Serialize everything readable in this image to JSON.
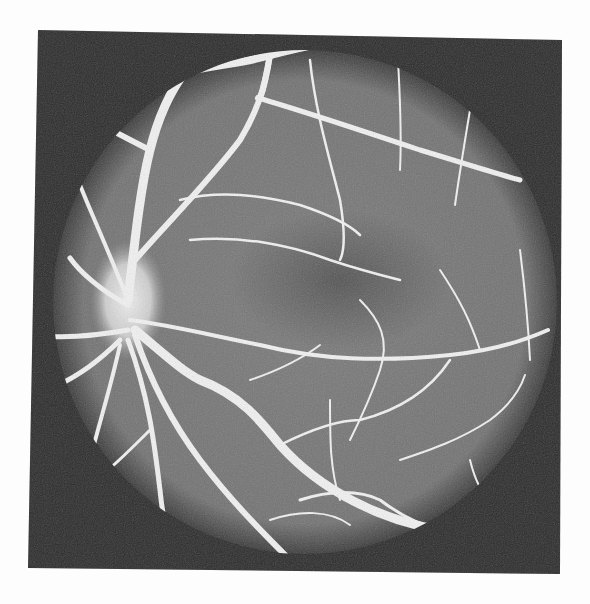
{
  "image": {
    "kind": "retinal fluorescein angiogram (grayscale fundus photograph)",
    "colors": {
      "page_background": "#fdfdfd",
      "frame_background": "#2b2b2b",
      "fundus_background": "#7a7a7a",
      "fundus_edge": "#3a3a3a",
      "vessel": "#f2f2f2",
      "optic_disc_glow": "#e8e8e8",
      "macula_dark": "#4a4a4a"
    },
    "frame": {
      "points": "38,30 562,40 560,574 28,568"
    },
    "fundus": {
      "cx": 305,
      "cy": 302,
      "r": 252
    },
    "optic_disc": {
      "cx": 128,
      "cy": 300,
      "rx": 38,
      "ry": 60
    },
    "macula": {
      "cx": 340,
      "cy": 280,
      "rx": 110,
      "ry": 70
    },
    "vessels": [
      {
        "d": "M128,300 C135,240 140,190 150,150 C160,110 175,85 185,72",
        "w": 9
      },
      {
        "d": "M185,72 C215,65 250,62 270,55 C290,50 310,45 330,42",
        "w": 8
      },
      {
        "d": "M270,55 C265,80 262,100 258,98",
        "w": 6
      },
      {
        "d": "M258,98 C300,110 360,130 420,150 C470,165 500,175 520,180",
        "w": 5
      },
      {
        "d": "M150,150 C130,140 115,132 108,128",
        "w": 6
      },
      {
        "d": "M135,260 C170,220 210,180 240,140 C255,115 265,90 270,55",
        "w": 6
      },
      {
        "d": "M180,200 C220,190 260,195 300,205 C330,215 350,225 360,235",
        "w": 2.5
      },
      {
        "d": "M190,240 C240,235 290,245 330,260 C360,270 380,275 400,280",
        "w": 2.5
      },
      {
        "d": "M310,60 C315,110 330,160 340,200 C345,230 345,250 340,260",
        "w": 2.5
      },
      {
        "d": "M398,60 C400,100 402,130 400,170",
        "w": 2
      },
      {
        "d": "M470,110 C465,140 460,170 455,205",
        "w": 2
      },
      {
        "d": "M128,305 C100,290 80,272 70,258",
        "w": 5
      },
      {
        "d": "M128,300 C100,230 85,200 75,172",
        "w": 4
      },
      {
        "d": "M128,330 C100,335 70,338 45,336",
        "w": 5
      },
      {
        "d": "M120,340 C100,360 80,375 58,385",
        "w": 5
      },
      {
        "d": "M130,320 C170,325 210,335 260,345 C320,360 380,362 450,355 C500,350 530,338 548,330",
        "w": 4
      },
      {
        "d": "M135,330 C160,350 180,370 200,380 C240,395 260,420 280,445 C320,490 380,520 440,530",
        "w": 9
      },
      {
        "d": "M135,335 C150,380 170,420 200,460 C230,500 260,530 300,570",
        "w": 6
      },
      {
        "d": "M128,340 C150,400 155,450 160,490 C162,510 165,525 168,530",
        "w": 5
      },
      {
        "d": "M120,345 C110,390 100,420 90,460 C85,480 85,485 88,490",
        "w": 4
      },
      {
        "d": "M150,430 C130,450 120,460 108,470",
        "w": 3
      },
      {
        "d": "M280,445 C310,430 340,420 360,420 C400,410 430,390 450,360",
        "w": 2.5
      },
      {
        "d": "M300,500 C330,490 360,490 380,500 C400,515 420,525 440,530",
        "w": 3
      },
      {
        "d": "M270,520 C300,510 330,510 350,525",
        "w": 2
      },
      {
        "d": "M250,380 C280,370 300,360 320,345",
        "w": 2
      },
      {
        "d": "M360,300 C380,320 390,340 380,370 C370,400 360,420 350,440",
        "w": 2
      },
      {
        "d": "M440,270 C460,300 470,320 480,350",
        "w": 2
      },
      {
        "d": "M520,250 C525,290 528,320 530,360",
        "w": 2
      },
      {
        "d": "M400,460 C430,450 460,440 490,420 C510,405 520,390 525,375",
        "w": 2
      },
      {
        "d": "M330,400 C330,440 330,470 340,500",
        "w": 2
      },
      {
        "d": "M470,460 C475,480 480,490 490,500",
        "w": 2
      }
    ]
  }
}
